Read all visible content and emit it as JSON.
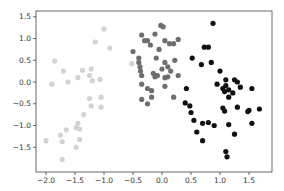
{
  "chart_data": {
    "type": "scatter",
    "title": "",
    "xlabel": "",
    "ylabel": "",
    "xlim": [
      -2.2,
      1.9
    ],
    "ylim": [
      -1.95,
      1.65
    ],
    "grid": false,
    "legend": null,
    "x_ticks": [
      -2.0,
      -1.5,
      -1.0,
      -0.5,
      0.0,
      0.5,
      1.0,
      1.5
    ],
    "x_tick_labels": [
      "−2.0",
      "−1.5",
      "−1.0",
      "−0.5",
      "0.0",
      "0.5",
      "1.0",
      "1.5"
    ],
    "y_ticks": [
      1.5,
      1.0,
      0.5,
      0.0,
      -0.5,
      -1.0,
      -1.5
    ],
    "y_tick_labels": [
      "1.5",
      "1.0",
      "0.5",
      "0.0",
      "−0.5",
      "−1.0",
      "−1.5"
    ],
    "series": [
      {
        "name": "cluster-light",
        "color": "#d3d3d3",
        "points": [
          [
            -1.0,
            1.22
          ],
          [
            -1.15,
            0.92
          ],
          [
            -0.9,
            0.78
          ],
          [
            -0.52,
            0.42
          ],
          [
            -1.37,
            0.27
          ],
          [
            -1.22,
            0.3
          ],
          [
            -1.45,
            0.1
          ],
          [
            -1.25,
            0.15
          ],
          [
            -1.62,
            0.0
          ],
          [
            -1.2,
            0.03
          ],
          [
            -1.07,
            0.06
          ],
          [
            -1.05,
            -0.35
          ],
          [
            -1.25,
            -0.38
          ],
          [
            -1.22,
            -0.55
          ],
          [
            -1.05,
            -0.58
          ],
          [
            -1.35,
            -0.75
          ],
          [
            -1.45,
            -0.95
          ],
          [
            -1.48,
            -1.05
          ],
          [
            -1.42,
            -1.08
          ],
          [
            -1.65,
            -1.1
          ],
          [
            -1.75,
            -1.22
          ],
          [
            -1.42,
            -1.32
          ],
          [
            -1.72,
            -1.37
          ],
          [
            -2.0,
            -1.35
          ],
          [
            -1.48,
            -1.5
          ],
          [
            -1.72,
            -1.78
          ],
          [
            -1.85,
            0.48
          ],
          [
            -1.7,
            0.25
          ],
          [
            -1.9,
            -0.05
          ]
        ]
      },
      {
        "name": "cluster-medium",
        "color": "#6e6e6e",
        "points": [
          [
            -0.02,
            1.3
          ],
          [
            0.02,
            1.27
          ],
          [
            -0.12,
            1.1
          ],
          [
            -0.35,
            1.08
          ],
          [
            -0.5,
            0.7
          ],
          [
            -0.3,
            0.95
          ],
          [
            -0.25,
            0.95
          ],
          [
            0.05,
            0.95
          ],
          [
            0.13,
            0.88
          ],
          [
            0.2,
            0.88
          ],
          [
            0.28,
            0.98
          ],
          [
            -0.2,
            0.85
          ],
          [
            -0.4,
            0.55
          ],
          [
            -0.4,
            0.45
          ],
          [
            -0.38,
            0.35
          ],
          [
            -0.37,
            0.25
          ],
          [
            -0.35,
            0.15
          ],
          [
            -0.1,
            0.55
          ],
          [
            0.05,
            0.45
          ],
          [
            0.1,
            0.35
          ],
          [
            -0.15,
            0.2
          ],
          [
            -0.12,
            0.12
          ],
          [
            -0.08,
            0.15
          ],
          [
            0.05,
            0.1
          ],
          [
            0.1,
            0.12
          ],
          [
            -0.35,
            -0.05
          ],
          [
            -0.25,
            -0.15
          ],
          [
            -0.18,
            -0.2
          ],
          [
            -0.35,
            -0.4
          ],
          [
            -0.25,
            -0.5
          ],
          [
            0.15,
            0.25
          ],
          [
            0.28,
            0.15
          ],
          [
            -0.18,
            -0.35
          ],
          [
            -0.05,
            0.75
          ],
          [
            0.22,
            0.5
          ],
          [
            0.05,
            -0.1
          ],
          [
            0.2,
            -0.35
          ],
          [
            0.0,
            0.3
          ]
        ]
      },
      {
        "name": "cluster-dark",
        "color": "#111111",
        "points": [
          [
            0.88,
            1.35
          ],
          [
            0.73,
            0.8
          ],
          [
            0.8,
            0.8
          ],
          [
            0.52,
            0.55
          ],
          [
            0.85,
            0.45
          ],
          [
            0.68,
            0.4
          ],
          [
            1.0,
            0.25
          ],
          [
            1.25,
            0.05
          ],
          [
            1.3,
            0.0
          ],
          [
            1.1,
            -0.08
          ],
          [
            0.42,
            -0.15
          ],
          [
            1.05,
            -0.15
          ],
          [
            1.08,
            -0.22
          ],
          [
            1.15,
            -0.18
          ],
          [
            1.15,
            -0.35
          ],
          [
            1.22,
            -0.25
          ],
          [
            1.35,
            -0.12
          ],
          [
            1.55,
            -0.15
          ],
          [
            0.4,
            -0.48
          ],
          [
            0.48,
            -0.55
          ],
          [
            0.5,
            -0.7
          ],
          [
            1.05,
            -0.6
          ],
          [
            1.08,
            -0.67
          ],
          [
            1.3,
            -0.58
          ],
          [
            1.48,
            -0.68
          ],
          [
            1.5,
            -0.65
          ],
          [
            1.68,
            -0.62
          ],
          [
            0.55,
            -0.88
          ],
          [
            0.7,
            -0.95
          ],
          [
            0.8,
            -0.93
          ],
          [
            0.9,
            -1.0
          ],
          [
            1.15,
            -0.98
          ],
          [
            0.6,
            -1.15
          ],
          [
            1.55,
            -0.95
          ],
          [
            1.25,
            -1.2
          ],
          [
            0.7,
            -1.35
          ],
          [
            1.1,
            -1.6
          ],
          [
            1.12,
            -1.72
          ],
          [
            0.95,
            -0.05
          ],
          [
            1.1,
            0.05
          ]
        ]
      }
    ]
  }
}
